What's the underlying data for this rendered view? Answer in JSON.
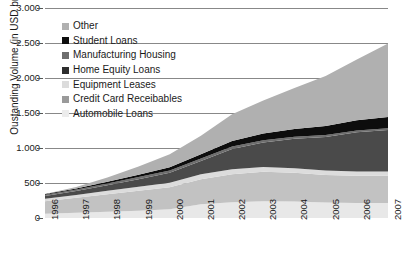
{
  "chart_data": {
    "type": "area",
    "stacked": true,
    "title": "",
    "xlabel": "",
    "ylabel": "Oustanding Volume (in USD bn)",
    "x": [
      1996,
      1997,
      1998,
      1999,
      2000,
      2001,
      2002,
      2003,
      2004,
      2005,
      2006,
      2007
    ],
    "xtick_labels": [
      "1996",
      "1997",
      "1998",
      "1999",
      "2000",
      "2001",
      "2002",
      "2003",
      "2004",
      "2005",
      "2006",
      "2007"
    ],
    "ylim": [
      0,
      3000
    ],
    "ytick_values": [
      0,
      500,
      1000,
      1500,
      2000,
      2500,
      3000
    ],
    "ytick_labels": [
      "0",
      "500",
      "1.000",
      "1.500",
      "2.000",
      "2.500",
      "3.000"
    ],
    "grid": true,
    "legend_position": "upper-left-inside",
    "series": [
      {
        "name": "Automobile Loans",
        "color": "#e8e8e8",
        "values": [
          60,
          75,
          90,
          105,
          125,
          195,
          225,
          240,
          235,
          220,
          215,
          215
        ]
      },
      {
        "name": "Credit Card Receibables",
        "color": "#c2c2c2",
        "values": [
          180,
          215,
          250,
          285,
          315,
          360,
          400,
          420,
          410,
          395,
          390,
          390
        ]
      },
      {
        "name": "Equipment Leases",
        "color": "#dcdcdc",
        "values": [
          35,
          40,
          48,
          55,
          62,
          70,
          72,
          70,
          66,
          62,
          60,
          58
        ]
      },
      {
        "name": "Home Equity Loans",
        "color": "#4a4a4a",
        "values": [
          40,
          55,
          80,
          110,
          145,
          190,
          290,
          350,
          420,
          480,
          560,
          595
        ]
      },
      {
        "name": "Manufacturing Housing",
        "color": "#6e6e6e",
        "values": [
          18,
          22,
          26,
          30,
          32,
          34,
          34,
          32,
          30,
          28,
          26,
          25
        ]
      },
      {
        "name": "Student Loans",
        "color": "#0d0d0d",
        "values": [
          10,
          16,
          24,
          34,
          46,
          62,
          80,
          96,
          112,
          128,
          145,
          160
        ]
      },
      {
        "name": "Other",
        "color": "#b0b0b0",
        "values": [
          0,
          20,
          60,
          115,
          185,
          265,
          380,
          470,
          585,
          715,
          870,
          1050
        ]
      }
    ],
    "legend_order_top_to_bottom": [
      "Other",
      "Student Loans",
      "Manufacturing Housing",
      "Home Equity Loans",
      "Equipment Leases",
      "Credit Card Receibables",
      "Automobile Loans"
    ]
  },
  "legend": {
    "items": [
      {
        "label": "Other",
        "color": "#b0b0b0"
      },
      {
        "label": "Student Loans",
        "color": "#0d0d0d"
      },
      {
        "label": "Manufacturing Housing",
        "color": "#6e6e6e"
      },
      {
        "label": "Home Equity Loans",
        "color": "#2e2e2e"
      },
      {
        "label": "Equipment Leases",
        "color": "#dcdcdc"
      },
      {
        "label": "Credit Card Receibables",
        "color": "#9a9a9a"
      },
      {
        "label": "Automobile Loans",
        "color": "#ececec"
      }
    ]
  },
  "axes": {
    "y_title": "Oustanding Volume (in USD bn)",
    "y_labels": [
      "3.000",
      "2.500",
      "2.000",
      "1.500",
      "1.000",
      "500",
      "0"
    ],
    "x_labels": [
      "1996",
      "1997",
      "1998",
      "1999",
      "2000",
      "2001",
      "2002",
      "2003",
      "2004",
      "2005",
      "2006",
      "2007"
    ]
  },
  "style": {
    "grid_color": "#888888",
    "axis_text_color": "#1a1a1a",
    "background": "#ffffff"
  }
}
